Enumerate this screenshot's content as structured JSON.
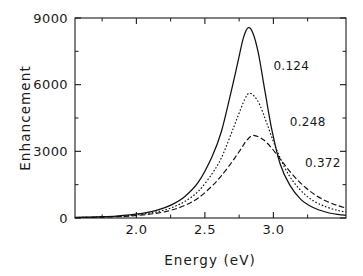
{
  "chart_data": {
    "type": "line",
    "title": "",
    "xlabel": "Energy  (eV)",
    "ylabel": "Enhancement",
    "xlim": [
      1.552,
      3.53
    ],
    "ylim": [
      0,
      9000
    ],
    "grid": false,
    "legend_position": "inline-right-of-curves",
    "x_ticks_major": [
      2.0,
      2.5,
      3.0
    ],
    "x_ticklabels": [
      "2.0",
      "2.5",
      "3.0"
    ],
    "x_ticks_minor": [
      1.75,
      2.25,
      2.75,
      3.25
    ],
    "y_ticks_major": [
      0,
      3000,
      6000,
      9000
    ],
    "y_ticklabels": [
      "0",
      "3000",
      "6000",
      "9000"
    ],
    "y_ticks_minor": [
      1500,
      4500,
      7500
    ],
    "annotations": [
      {
        "text": "0.124",
        "x": 3.0,
        "y": 6640
      },
      {
        "text": "0.248",
        "x": 3.12,
        "y": 4140
      },
      {
        "text": "0.372",
        "x": 3.23,
        "y": 2290
      }
    ],
    "series": [
      {
        "name": "0.124",
        "style": "solid",
        "peak_x": 2.815,
        "peak_y": 8560,
        "hwhm": 0.132,
        "x": [
          1.552,
          1.652,
          1.752,
          1.852,
          1.952,
          2.052,
          2.152,
          2.252,
          2.352,
          2.452,
          2.552,
          2.62,
          2.69,
          2.74,
          2.78,
          2.815,
          2.85,
          2.89,
          2.94,
          2.99,
          3.05,
          3.12,
          3.2,
          3.29,
          3.38,
          3.47,
          3.53
        ],
        "y": [
          28,
          40,
          58,
          88,
          138,
          218,
          352,
          580,
          960,
          1610,
          2760,
          3880,
          5640,
          6990,
          8080,
          8560,
          8330,
          7430,
          5650,
          3930,
          2420,
          1480,
          840,
          470,
          270,
          160,
          120
        ]
      },
      {
        "name": "0.248",
        "style": "dotted",
        "peak_x": 2.822,
        "peak_y": 5610,
        "hwhm": 0.158,
        "x": [
          1.552,
          1.652,
          1.752,
          1.852,
          1.952,
          2.052,
          2.152,
          2.252,
          2.352,
          2.452,
          2.552,
          2.62,
          2.69,
          2.74,
          2.79,
          2.822,
          2.86,
          2.9,
          2.95,
          3.01,
          3.08,
          3.15,
          3.23,
          3.31,
          3.39,
          3.47,
          3.53
        ],
        "y": [
          22,
          32,
          48,
          72,
          112,
          176,
          280,
          452,
          740,
          1200,
          1990,
          2700,
          3760,
          4560,
          5330,
          5610,
          5480,
          5100,
          4300,
          3280,
          2300,
          1600,
          1060,
          710,
          490,
          340,
          270
        ]
      },
      {
        "name": "0.372",
        "style": "dashed",
        "peak_x": 2.84,
        "peak_y": 3700,
        "hwhm": 0.205,
        "x": [
          1.552,
          1.652,
          1.752,
          1.852,
          1.952,
          2.052,
          2.152,
          2.252,
          2.352,
          2.452,
          2.552,
          2.62,
          2.7,
          2.76,
          2.8,
          2.84,
          2.88,
          2.93,
          2.99,
          3.06,
          3.14,
          3.22,
          3.3,
          3.38,
          3.46,
          3.53
        ],
        "y": [
          18,
          26,
          38,
          58,
          88,
          138,
          218,
          348,
          560,
          900,
          1440,
          1900,
          2540,
          3080,
          3450,
          3700,
          3680,
          3510,
          3130,
          2570,
          1950,
          1450,
          1060,
          780,
          580,
          450
        ]
      }
    ]
  },
  "axes": {
    "x_title": "Energy  (eV)",
    "y_title": "Enhancement"
  }
}
